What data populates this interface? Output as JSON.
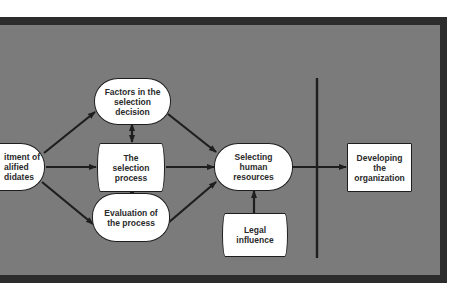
{
  "diagram": {
    "title": "",
    "colors": {
      "panel_fill": "#7b7b7b",
      "panel_border": "#2c2c2c",
      "node_fill": "#ffffff",
      "line": "#1e1e1e",
      "text": "#2a2a2a"
    },
    "nodes": {
      "recruitment": {
        "label": "itment of\nalified\ndidates",
        "shape": "oval"
      },
      "factors": {
        "label": "Factors in the\nselection\ndecision",
        "shape": "oval"
      },
      "selection_process": {
        "label": "The\nselection\nprocess",
        "shape": "curved-box"
      },
      "evaluation": {
        "label": "Evaluation of\nthe process",
        "shape": "oval"
      },
      "selecting": {
        "label": "Selecting\nhuman\nresources",
        "shape": "oval"
      },
      "legal": {
        "label": "Legal\ninfluence",
        "shape": "curved-box"
      },
      "developing": {
        "label": "Developing\nthe\norganization",
        "shape": "rectangle"
      }
    },
    "edges": [
      {
        "from": "recruitment",
        "to": "factors",
        "type": "arrow"
      },
      {
        "from": "recruitment",
        "to": "selection_process",
        "type": "arrow"
      },
      {
        "from": "recruitment",
        "to": "evaluation",
        "type": "arrow"
      },
      {
        "from": "factors",
        "to": "selection_process",
        "type": "double-arrow"
      },
      {
        "from": "selection_process",
        "to": "evaluation",
        "type": "double-arrow"
      },
      {
        "from": "factors",
        "to": "selecting",
        "type": "arrow"
      },
      {
        "from": "selection_process",
        "to": "selecting",
        "type": "arrow"
      },
      {
        "from": "evaluation",
        "to": "selecting",
        "type": "arrow"
      },
      {
        "from": "legal",
        "to": "selecting",
        "type": "arrow"
      },
      {
        "from": "selecting",
        "to": "developing",
        "type": "arrow"
      }
    ],
    "divider": {
      "type": "vertical-line"
    }
  }
}
